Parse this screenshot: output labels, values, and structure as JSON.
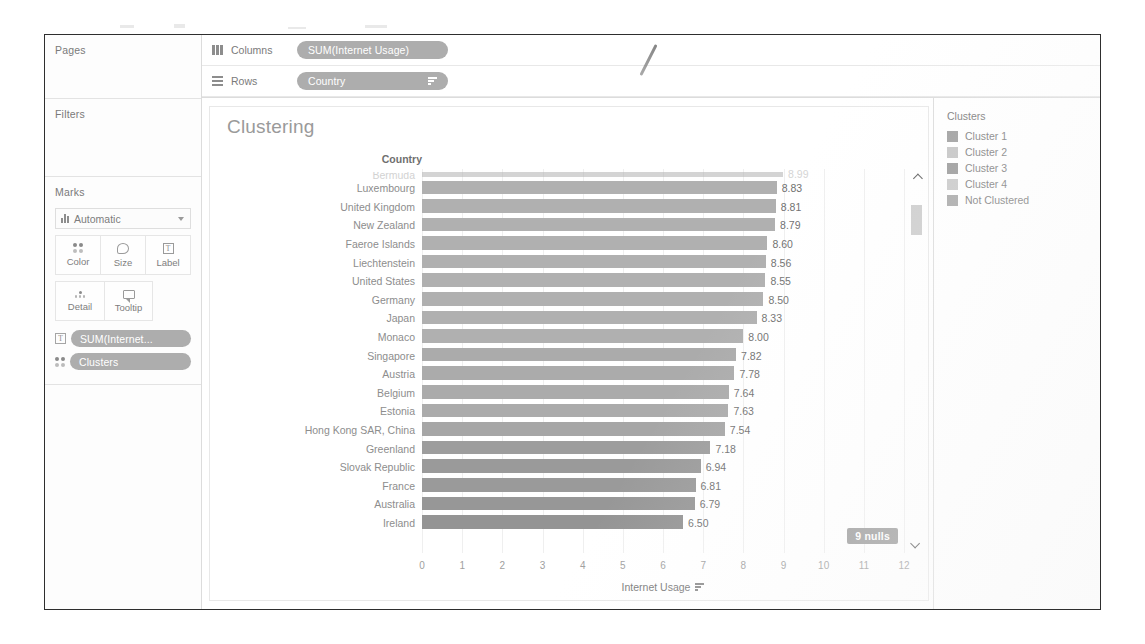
{
  "left_panel": {
    "pages_label": "Pages",
    "filters_label": "Filters",
    "marks_label": "Marks",
    "marks_type": "Automatic",
    "mark_buttons": [
      {
        "label": "Color",
        "icon": "color-icon"
      },
      {
        "label": "Size",
        "icon": "size-icon"
      },
      {
        "label": "Label",
        "icon": "label-icon"
      },
      {
        "label": "Detail",
        "icon": "detail-icon"
      },
      {
        "label": "Tooltip",
        "icon": "tooltip-icon"
      }
    ],
    "card_pills": [
      {
        "label": "SUM(Internet...",
        "icon": "label-icon"
      },
      {
        "label": "Clusters",
        "icon": "color-icon"
      }
    ]
  },
  "shelves": {
    "columns_label": "Columns",
    "columns_pill": "SUM(Internet Usage)",
    "rows_label": "Rows",
    "rows_pill": "Country"
  },
  "viz": {
    "title": "Clustering",
    "row_header": "Country",
    "nulls_badge": "9 nulls"
  },
  "legend": {
    "title": "Clusters",
    "items": [
      {
        "label": "Cluster 1",
        "color": "#9e9e9e"
      },
      {
        "label": "Cluster 2",
        "color": "#c4c4c4"
      },
      {
        "label": "Cluster 3",
        "color": "#9a9a9a"
      },
      {
        "label": "Cluster 4",
        "color": "#c9c9c9"
      },
      {
        "label": "Not Clustered",
        "color": "#a8a8a8"
      }
    ]
  },
  "chart_data": {
    "type": "bar",
    "title": "Clustering",
    "orientation": "horizontal",
    "xlabel": "Internet Usage",
    "ylabel": "Country",
    "xlim": [
      0,
      12
    ],
    "xticks": [
      0,
      1,
      2,
      3,
      4,
      5,
      6,
      7,
      8,
      9,
      10,
      11,
      12
    ],
    "grid": true,
    "legend_position": "right",
    "categories": [
      "Bermuda",
      "Luxembourg",
      "United Kingdom",
      "New Zealand",
      "Faeroe Islands",
      "Liechtenstein",
      "United States",
      "Germany",
      "Japan",
      "Monaco",
      "Singapore",
      "Austria",
      "Belgium",
      "Estonia",
      "Hong Kong SAR, China",
      "Greenland",
      "Slovak Republic",
      "France",
      "Australia",
      "Ireland"
    ],
    "values": [
      8.99,
      8.83,
      8.81,
      8.79,
      8.6,
      8.56,
      8.55,
      8.5,
      8.33,
      8.0,
      7.82,
      7.78,
      7.64,
      7.63,
      7.54,
      7.18,
      6.94,
      6.81,
      6.79,
      6.5
    ],
    "value_labels": [
      "8.99",
      "8.83",
      "8.81",
      "8.79",
      "8.60",
      "8.56",
      "8.55",
      "8.50",
      "8.33",
      "8.00",
      "7.82",
      "7.78",
      "7.64",
      "7.63",
      "7.54",
      "7.18",
      "6.94",
      "6.81",
      "6.79",
      "6.50"
    ],
    "bar_colors": [
      "#b0b0b0",
      "#b0b0b0",
      "#b0b0b0",
      "#b0b0b0",
      "#b0b0b0",
      "#b0b0b0",
      "#b0b0b0",
      "#b0b0b0",
      "#b0b0b0",
      "#b0b0b0",
      "#ababab",
      "#ababab",
      "#ababab",
      "#ababab",
      "#a6a6a6",
      "#9d9d9d",
      "#9a9a9a",
      "#9a9a9a",
      "#979797",
      "#949494"
    ],
    "first_row_clipped": true,
    "nulls": "9 nulls"
  }
}
